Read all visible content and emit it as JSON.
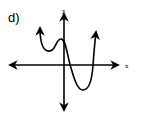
{
  "figure": {
    "part_label": "d)",
    "x_axis_label": "x",
    "y_axis_label": "y",
    "colors": {
      "stroke": "#000000",
      "background": "#ffffff"
    }
  }
}
